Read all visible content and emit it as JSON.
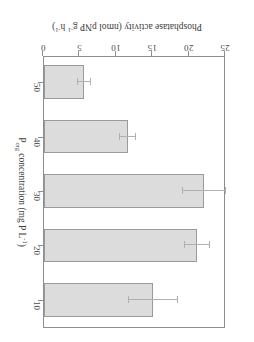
{
  "chart_data": {
    "type": "bar",
    "orientation": "horizontal",
    "title": "",
    "categories": [
      "10",
      "20",
      "30",
      "40",
      "50"
    ],
    "values": [
      15.0,
      21.0,
      22.0,
      11.5,
      5.5
    ],
    "errors": [
      3.4,
      1.8,
      3.0,
      1.2,
      0.9
    ],
    "xlabel_parts": {
      "base": "P",
      "subscript": "org",
      "rest": " concentration (mg P L",
      "exponent": "-1",
      "close": ")"
    },
    "ylabel_parts": {
      "lead": "Phosphatase activity (nmol pNP g",
      "exp1": "-1",
      "mid": " h",
      "exp2": "-1",
      "close": ")"
    },
    "value_ticks": [
      "0",
      "5",
      "10",
      "15",
      "20",
      "25"
    ],
    "value_tick_values": [
      0,
      5,
      10,
      15,
      20,
      25
    ],
    "ylim": [
      0,
      25
    ],
    "category_ticks": [
      "10",
      "20",
      "30",
      "40",
      "50"
    ],
    "grid": false,
    "legend": false,
    "bar_color": "#dcdcdc",
    "bar_edge_color": "#9a9a9a",
    "axis_color": "#8d8d8d",
    "rotation_degrees": 180
  }
}
